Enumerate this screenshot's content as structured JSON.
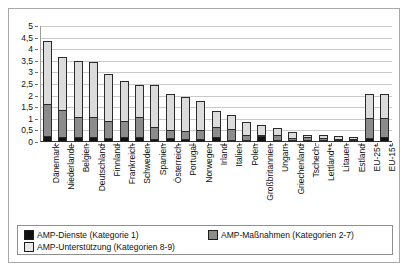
{
  "chart_data": {
    "type": "bar",
    "stacked": true,
    "title": "",
    "subtitle": "",
    "xlabel": "",
    "ylabel": "",
    "ylim": [
      0,
      5
    ],
    "ytick_labels": [
      "5",
      "4,5",
      "4",
      "3,5",
      "3",
      "2,5",
      "2",
      "1,5",
      "1",
      "0,5",
      "0"
    ],
    "ytick_values": [
      5,
      4.5,
      4,
      3.5,
      3,
      2.5,
      2,
      1.5,
      1,
      0.5,
      0
    ],
    "grid": true,
    "legend_position": "bottom",
    "categories": [
      "Dänemark",
      "Niederlande",
      "Belgien",
      "Deutschland",
      "Finnland",
      "Frankreich",
      "Schweden",
      "Spanien",
      "Österreich",
      "Portugal",
      "Norwegen",
      "Irland",
      "Italien",
      "Polen",
      "Großbritannien",
      "Ungarn",
      "Griechenland",
      "Tschech.",
      "Lettland**",
      "Litauen",
      "Estland",
      "EU-25*",
      "EU-15*"
    ],
    "series": [
      {
        "name": "AMP-Dienste (Kategorie 1)",
        "color": "#111111",
        "values": [
          0.25,
          0.2,
          0.2,
          0.22,
          0.18,
          0.22,
          0.21,
          0.12,
          0.16,
          0.15,
          0.15,
          0.21,
          0.04,
          0.06,
          0.26,
          0.06,
          0.07,
          0.1,
          0.03,
          0.05,
          0.03,
          0.18,
          0.2
        ]
      },
      {
        "name": "AMP-Maßnahmen (Kategorien 2-7)",
        "color": "#8c8c8c",
        "values": [
          1.4,
          1.2,
          0.9,
          0.86,
          0.72,
          0.7,
          0.89,
          0.53,
          0.34,
          0.33,
          0.38,
          0.45,
          0.46,
          0.21,
          0.05,
          0.22,
          0.1,
          0.11,
          0.1,
          0.04,
          0.03,
          0.84,
          0.85
        ]
      },
      {
        "name": "AMP-Unterstützung (Kategorien 8-9)",
        "color": "#dcdcdc",
        "values": [
          2.7,
          2.25,
          2.4,
          2.37,
          2.05,
          1.73,
          1.37,
          1.81,
          1.55,
          1.46,
          1.23,
          0.69,
          0.6,
          0.57,
          0.43,
          0.3,
          0.25,
          0.1,
          0.12,
          0.14,
          0.09,
          1.03,
          1.0
        ]
      }
    ],
    "totals": [
      4.35,
      3.65,
      3.5,
      3.45,
      2.95,
      2.65,
      2.47,
      2.46,
      2.05,
      1.94,
      1.76,
      1.35,
      1.1,
      0.84,
      0.74,
      0.58,
      0.42,
      0.31,
      0.25,
      0.23,
      0.15,
      2.05,
      2.05
    ]
  },
  "legend": {
    "items": [
      {
        "label": "AMP-Dienste (Kategorie 1)",
        "swatch": "black-square-icon"
      },
      {
        "label": "AMP-Maßnahmen (Kategorien 2-7)",
        "swatch": "gray-square-icon"
      },
      {
        "label": "AMP-Unterstützung (Kategorien 8-9)",
        "swatch": "light-gray-square-icon"
      }
    ]
  }
}
